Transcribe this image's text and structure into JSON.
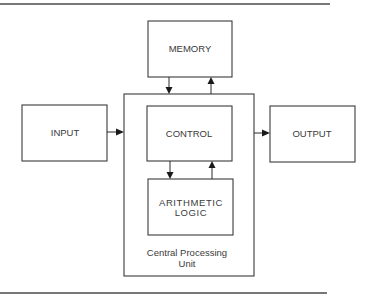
{
  "diagram": {
    "type": "block-diagram",
    "title": "",
    "nodes": [
      {
        "id": "memory",
        "label": "MEMORY"
      },
      {
        "id": "input",
        "label": "INPUT"
      },
      {
        "id": "control",
        "label": "CONTROL"
      },
      {
        "id": "output",
        "label": "OUTPUT"
      },
      {
        "id": "alu",
        "label_line1": "ARITHMETIC",
        "label_line2": "LOGIC"
      },
      {
        "id": "cpu",
        "label_line1": "Central Processing",
        "label_line2": "Unit",
        "contains": [
          "control",
          "alu"
        ]
      }
    ],
    "edges": [
      {
        "from": "memory",
        "to": "cpu"
      },
      {
        "from": "cpu",
        "to": "memory"
      },
      {
        "from": "input",
        "to": "cpu"
      },
      {
        "from": "cpu",
        "to": "output"
      },
      {
        "from": "control",
        "to": "alu"
      },
      {
        "from": "alu",
        "to": "control"
      }
    ]
  },
  "labels": {
    "memory": "MEMORY",
    "input": "INPUT",
    "control": "CONTROL",
    "output": "OUTPUT",
    "alu_line1": "ARITHMETIC",
    "alu_line2": "LOGIC",
    "cpu_line1": "Central Processing",
    "cpu_line2": "Unit"
  }
}
